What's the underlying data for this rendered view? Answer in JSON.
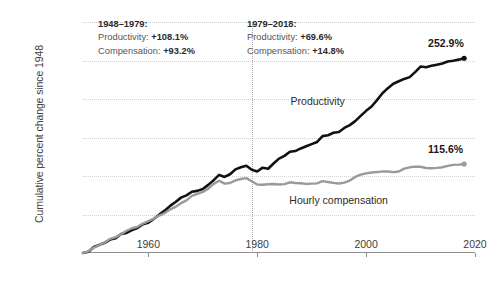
{
  "chart_data": {
    "type": "line",
    "title": "",
    "xlabel": "",
    "ylabel": "Cumulative percent change since 1948",
    "xlim": [
      1948,
      2020
    ],
    "ylim": [
      0,
      300
    ],
    "yticks": [
      "0",
      "50",
      "100",
      "150",
      "200",
      "250",
      "300%"
    ],
    "ytick_values": [
      0,
      50,
      100,
      150,
      200,
      250,
      300
    ],
    "xticks": [
      "1960",
      "1980",
      "2000",
      "2020"
    ],
    "xtick_values": [
      1960,
      1980,
      2000,
      2020
    ],
    "grid": "horizontal-dotted",
    "legend": "inline-labels",
    "divider_year": 1979,
    "series": [
      {
        "name": "Productivity",
        "color": "#111111",
        "label_x": 1992,
        "label_y": 196,
        "end_label": "252.9%",
        "end_value": 252.9,
        "x": [
          1948,
          1949,
          1950,
          1951,
          1952,
          1953,
          1954,
          1955,
          1956,
          1957,
          1958,
          1959,
          1960,
          1961,
          1962,
          1963,
          1964,
          1965,
          1966,
          1967,
          1968,
          1969,
          1970,
          1971,
          1972,
          1973,
          1974,
          1975,
          1976,
          1977,
          1978,
          1979,
          1980,
          1981,
          1982,
          1983,
          1984,
          1985,
          1986,
          1987,
          1988,
          1989,
          1990,
          1991,
          1992,
          1993,
          1994,
          1995,
          1996,
          1997,
          1998,
          1999,
          2000,
          2001,
          2002,
          2003,
          2004,
          2005,
          2006,
          2007,
          2008,
          2009,
          2010,
          2011,
          2012,
          2013,
          2014,
          2015,
          2016,
          2017,
          2018
        ],
        "y": [
          0,
          1.5,
          7.8,
          10.5,
          13.2,
          17.4,
          19.2,
          24.6,
          26.1,
          29.8,
          32.4,
          37.5,
          39.4,
          44.2,
          49.8,
          55.0,
          61.2,
          66.3,
          71.9,
          74.8,
          79.6,
          80.7,
          83.2,
          88.5,
          94.6,
          101.5,
          98.8,
          102.3,
          108.6,
          111.4,
          113.3,
          108.1,
          105.9,
          110.8,
          109.4,
          116.3,
          122.6,
          126.1,
          131.4,
          132.4,
          135.8,
          138.7,
          141.4,
          144.2,
          151.8,
          153.0,
          156.1,
          157.2,
          162.4,
          166.1,
          171.3,
          178.1,
          184.6,
          190.3,
          198.6,
          207.4,
          214.1,
          219.8,
          223.0,
          226.1,
          228.4,
          234.9,
          242.1,
          241.3,
          243.1,
          244.5,
          246.0,
          248.6,
          249.7,
          251.1,
          252.9
        ]
      },
      {
        "name": "Hourly compensation",
        "color": "#9a9a9a",
        "label_x": 1996,
        "label_y": 68,
        "end_label": "115.6%",
        "end_value": 115.6,
        "x": [
          1948,
          1949,
          1950,
          1951,
          1952,
          1953,
          1954,
          1955,
          1956,
          1957,
          1958,
          1959,
          1960,
          1961,
          1962,
          1963,
          1964,
          1965,
          1966,
          1967,
          1968,
          1969,
          1970,
          1971,
          1972,
          1973,
          1974,
          1975,
          1976,
          1977,
          1978,
          1979,
          1980,
          1981,
          1982,
          1983,
          1984,
          1985,
          1986,
          1987,
          1988,
          1989,
          1990,
          1991,
          1992,
          1993,
          1994,
          1995,
          1996,
          1997,
          1998,
          1999,
          2000,
          2001,
          2002,
          2003,
          2004,
          2005,
          2006,
          2007,
          2008,
          2009,
          2010,
          2011,
          2012,
          2013,
          2014,
          2015,
          2016,
          2017,
          2018
        ],
        "y": [
          0,
          2.2,
          7.0,
          10.2,
          13.6,
          18.4,
          20.6,
          24.3,
          28.9,
          32.1,
          34.0,
          38.2,
          41.3,
          44.6,
          48.6,
          51.8,
          56.6,
          60.0,
          64.7,
          68.4,
          74.1,
          76.8,
          79.4,
          83.6,
          89.8,
          93.8,
          90.1,
          90.9,
          94.4,
          96.1,
          97.2,
          93.2,
          89.0,
          88.6,
          89.3,
          89.6,
          88.9,
          89.4,
          91.8,
          90.9,
          90.6,
          89.7,
          90.1,
          90.4,
          93.4,
          92.2,
          91.1,
          90.3,
          91.4,
          94.1,
          98.8,
          101.7,
          103.4,
          104.6,
          105.1,
          106.0,
          105.8,
          105.1,
          105.9,
          109.6,
          111.3,
          112.2,
          112.0,
          110.4,
          110.1,
          110.6,
          111.4,
          113.2,
          114.4,
          114.8,
          115.6
        ]
      }
    ],
    "annotations": [
      {
        "period": "1948–1979:",
        "productivity_label": "Productivity:",
        "productivity_value": "+108.1%",
        "compensation_label": "Compensation:",
        "compensation_value": "+93.2%"
      },
      {
        "period": "1979–2018:",
        "productivity_label": "Productivity:",
        "productivity_value": "+69.6%",
        "compensation_label": "Compensation:",
        "compensation_value": "+14.8%"
      }
    ]
  }
}
